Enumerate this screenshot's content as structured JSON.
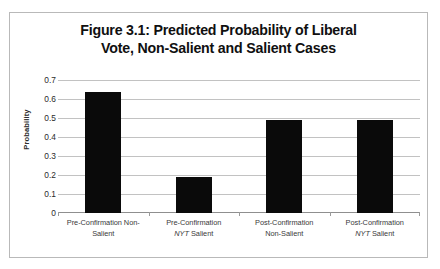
{
  "chart_data": {
    "type": "bar",
    "title": "Figure 3.1: Predicted Probability of Liberal Vote, Non-Salient and Salient Cases",
    "title_lines": [
      "Figure 3.1: Predicted Probability of Liberal",
      "Vote, Non-Salient and Salient Cases"
    ],
    "xlabel": "",
    "ylabel": "Probability",
    "ylim": [
      0,
      0.7
    ],
    "ytick_values": [
      0.7,
      0.6,
      0.5,
      0.4,
      0.3,
      0.2,
      0.1,
      0
    ],
    "ytick_labels": [
      "0.7",
      "0.6",
      "0.5",
      "0.4",
      "0.3",
      "0.2",
      "0.1",
      "0"
    ],
    "grid": true,
    "legend": null,
    "bar_color": "#0a0a0a",
    "gridline_color": "#c2c2c2",
    "categories": [
      "Pre-Confirmation Non-Salient",
      "Pre-Confirmation NYT Salient",
      "Post-Confirmation Non-Salient",
      "Post-Confirmation NYT Salient"
    ],
    "category_label_lines": [
      [
        "Pre-Confirmation Non-",
        "Salient"
      ],
      [
        "Pre-Confirmation",
        "NYT Salient"
      ],
      [
        "Post-Confirmation",
        "Non-Salient"
      ],
      [
        "Post-Confirmation",
        "NYT Salient"
      ]
    ],
    "category_label_italic_token": "NYT",
    "values": [
      0.635,
      0.19,
      0.49,
      0.49
    ]
  }
}
